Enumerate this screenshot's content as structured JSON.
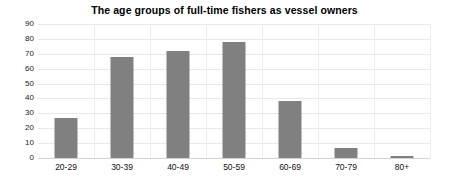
{
  "chart_data": {
    "type": "bar",
    "title": "The age groups of full-time fishers as vessel owners",
    "xlabel": "",
    "ylabel": "",
    "categories": [
      "20-29",
      "30-39",
      "40-49",
      "50-59",
      "60-69",
      "70-79",
      "80+"
    ],
    "values": [
      27,
      68,
      72,
      78,
      38,
      7,
      1
    ],
    "ylim": [
      0,
      90
    ],
    "ytick_labels": [
      "90",
      "80",
      "70",
      "60",
      "50",
      "40",
      "30",
      "20",
      "10",
      "0"
    ],
    "ytick_values": [
      90,
      80,
      70,
      60,
      50,
      40,
      30,
      20,
      10,
      0
    ],
    "grid": {
      "horizontal": true,
      "vertical": true
    },
    "legend": {
      "visible": false,
      "position": "none"
    },
    "series": [
      {
        "name": "Full-time fishers as vessel owners",
        "color": "#808080",
        "values": [
          27,
          68,
          72,
          78,
          38,
          7,
          1
        ]
      }
    ]
  }
}
